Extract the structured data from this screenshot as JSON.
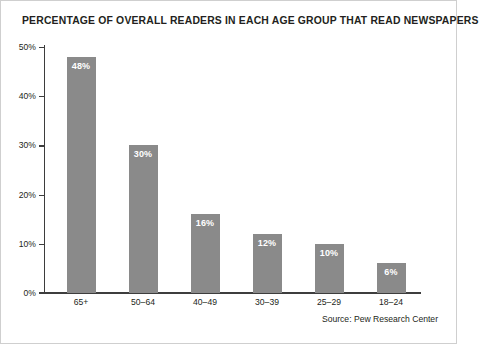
{
  "figure": {
    "border_color": "#cfcfcf",
    "background": "#ffffff"
  },
  "source_note": "Source: Pew Research Center",
  "chart_data": {
    "type": "bar",
    "title": "PERCENTAGE OF OVERALL READERS IN EACH AGE GROUP THAT READ NEWSPAPERS",
    "xlabel": "",
    "ylabel": "",
    "categories": [
      "65+",
      "50–64",
      "40–49",
      "30–39",
      "25–29",
      "18–24"
    ],
    "values": [
      48,
      30,
      16,
      12,
      10,
      6
    ],
    "value_labels": [
      "48%",
      "30%",
      "16%",
      "12%",
      "10%",
      "6%"
    ],
    "ylim": [
      0,
      50
    ],
    "yticks": [
      0,
      10,
      20,
      30,
      40,
      50
    ],
    "ytick_labels": [
      "0%",
      "10%",
      "20%",
      "30%",
      "40%",
      "50%"
    ],
    "grid": false,
    "legend": false,
    "bar_color": "#8a8a8a",
    "label_color": "#ffffff",
    "axis_color": "#3d3d3d"
  }
}
